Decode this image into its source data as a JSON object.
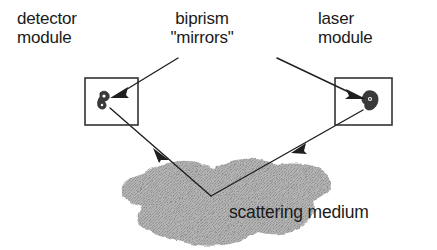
{
  "figure": {
    "width": 437,
    "height": 250,
    "background_color": "#ffffff",
    "ink_color": "#1a1a1a",
    "medium_fill_color": "#a8a8a8",
    "caption_free": true
  },
  "labels": {
    "detector_module": "detector\nmodule",
    "biprism_mirrors": "biprism\n\"mirrors\"",
    "laser_module": "laser\nmodule",
    "scattering_medium": "scattering medium"
  },
  "components": {
    "detector_box": {
      "name": "detector module",
      "x": 85,
      "y": 78,
      "width": 53,
      "height": 47
    },
    "laser_box": {
      "name": "laser module",
      "x": 335,
      "y": 78,
      "width": 57,
      "height": 47
    },
    "detector_biprism": {
      "name": "biprism mirror in detector module",
      "cx": 103,
      "cy": 99
    },
    "laser_biprism": {
      "name": "biprism mirror in laser module",
      "cx": 371,
      "cy": 99
    },
    "scattering_medium": {
      "name": "scattering medium",
      "bounds": [
        120,
        158,
        332,
        246
      ]
    },
    "scattering_point": {
      "name": "turning point of light path inside medium",
      "x": 211,
      "y": 196
    }
  },
  "leader_lines": [
    {
      "name": "biprism-label-to-detector",
      "from": [
        178,
        58
      ],
      "to": [
        116,
        96
      ],
      "arrowhead": "at-detector-biprism"
    },
    {
      "name": "biprism-label-to-laser",
      "from": [
        277,
        58
      ],
      "to": [
        358,
        96
      ],
      "arrowhead": "at-laser-biprism"
    }
  ],
  "light_path": {
    "name": "laser beam through scattering medium",
    "segments": [
      {
        "name": "laser-to-medium",
        "from": [
          363,
          110
        ],
        "to": [
          211,
          196
        ],
        "arrowhead_at": [
          295,
          150
        ],
        "direction": "down-left"
      },
      {
        "name": "medium-to-detector",
        "from": [
          211,
          196
        ],
        "to": [
          110,
          108
        ],
        "arrowhead_at": [
          157,
          152
        ],
        "direction": "up-left"
      }
    ]
  }
}
